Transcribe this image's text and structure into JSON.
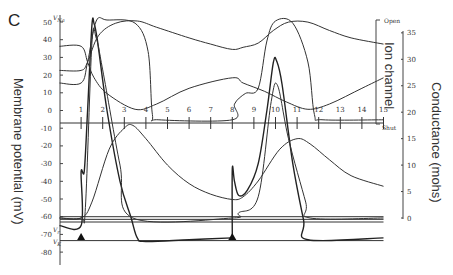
{
  "chart_data": {
    "type": "line",
    "panel_label": "C",
    "left_axis": {
      "title": "Membrane potential (mV)",
      "ticks": [
        50,
        40,
        30,
        20,
        10,
        0,
        -10,
        -20,
        -30,
        -40,
        -50,
        -60,
        -70,
        -80
      ],
      "tick_labels": [
        "50",
        "40",
        "30",
        "20",
        "10",
        "0",
        "-10",
        "-20",
        "-30",
        "-40",
        "-50",
        "-60",
        "-70",
        "-80"
      ],
      "range": [
        -85,
        52
      ],
      "markers": [
        {
          "label": "VNa",
          "value": 53
        },
        {
          "label": "Vr",
          "value": -67
        },
        {
          "label": "VK",
          "value": -74
        }
      ]
    },
    "right_axis": {
      "title": "Conductance (mohs)",
      "ticks": [
        0,
        5,
        10,
        15,
        20,
        25,
        30,
        35
      ],
      "tick_labels": [
        "0",
        "5",
        "10",
        "15",
        "20",
        "25",
        "30",
        "35"
      ],
      "range": [
        0,
        35
      ]
    },
    "ion_channel_axis": {
      "title": "Ion channel",
      "top_label": "Open",
      "bottom_label": "Shut"
    },
    "time_axis": {
      "ticks": [
        1,
        2,
        3,
        4,
        5,
        6,
        7,
        8,
        9,
        10,
        11,
        12,
        13,
        14,
        15
      ],
      "tick_labels": [
        "1",
        "2",
        "3",
        "4",
        "5",
        "6",
        "7",
        "8",
        "9",
        "10",
        "11",
        "12",
        "13",
        "14",
        "15"
      ],
      "range": [
        0,
        15
      ]
    },
    "stimuli": [
      {
        "label": "stimulus-1",
        "time": 1
      },
      {
        "label": "stimulus-2",
        "time": 8
      }
    ],
    "series": [
      {
        "name": "Membrane potential (action potential 1)",
        "axis": "left",
        "points": [
          [
            0,
            -65
          ],
          [
            1,
            -65
          ],
          [
            1,
            -35
          ],
          [
            1.15,
            -34
          ],
          [
            1.3,
            0
          ],
          [
            1.5,
            48
          ],
          [
            1.6,
            49
          ],
          [
            1.75,
            40
          ],
          [
            2.2,
            0
          ],
          [
            2.8,
            -40
          ],
          [
            3.3,
            -60
          ],
          [
            3.6,
            -72
          ],
          [
            4,
            -74
          ],
          [
            6,
            -73
          ],
          [
            8,
            -72
          ]
        ]
      },
      {
        "name": "Membrane potential (action potential 2)",
        "axis": "left",
        "points": [
          [
            8,
            -72
          ],
          [
            8,
            -33
          ],
          [
            8.1,
            -40
          ],
          [
            8.3,
            -48
          ],
          [
            8.7,
            -45
          ],
          [
            9.2,
            -30
          ],
          [
            9.6,
            0
          ],
          [
            9.9,
            27
          ],
          [
            10.05,
            28
          ],
          [
            10.3,
            15
          ],
          [
            10.8,
            -30
          ],
          [
            11.3,
            -62
          ],
          [
            11.5,
            -73
          ],
          [
            15,
            -72
          ]
        ]
      },
      {
        "name": "Na conductance",
        "axis": "right",
        "points": [
          [
            0,
            0
          ],
          [
            1,
            0
          ],
          [
            1.2,
            2
          ],
          [
            1.5,
            33
          ],
          [
            1.7,
            34
          ],
          [
            2.0,
            28
          ],
          [
            2.8,
            10
          ],
          [
            3.4,
            0
          ],
          [
            8,
            0
          ],
          [
            8.3,
            1
          ],
          [
            9.2,
            4
          ],
          [
            9.8,
            22
          ],
          [
            10.1,
            25
          ],
          [
            10.6,
            15
          ],
          [
            11.4,
            3
          ],
          [
            11.6,
            0
          ],
          [
            15,
            0
          ]
        ]
      },
      {
        "name": "K conductance",
        "axis": "right",
        "points": [
          [
            0,
            0
          ],
          [
            1,
            0
          ],
          [
            1.5,
            3
          ],
          [
            2.3,
            13
          ],
          [
            3.0,
            17
          ],
          [
            3.4,
            17.5
          ],
          [
            4,
            15
          ],
          [
            5,
            10
          ],
          [
            6,
            6.5
          ],
          [
            7,
            4.5
          ],
          [
            8,
            3.5
          ],
          [
            8.5,
            4
          ],
          [
            9.2,
            7
          ],
          [
            10.2,
            13
          ],
          [
            11,
            15
          ],
          [
            11.6,
            14
          ],
          [
            12.5,
            11
          ],
          [
            13.5,
            8
          ],
          [
            15,
            6
          ]
        ]
      },
      {
        "name": "Na channel (activation)",
        "axis": "channel",
        "points": [
          [
            0,
            0.4
          ],
          [
            1,
            0.4
          ],
          [
            1.3,
            0.6
          ],
          [
            1.7,
            0.99
          ],
          [
            2.2,
            1.0
          ],
          [
            3.5,
            0.97
          ],
          [
            4.1,
            0.7
          ],
          [
            4.3,
            0.1
          ],
          [
            4.6,
            0.05
          ],
          [
            8,
            0.05
          ],
          [
            8.1,
            0.2
          ],
          [
            8.6,
            0.3
          ],
          [
            9.2,
            0.35
          ],
          [
            9.6,
            0.8
          ],
          [
            10,
            0.99
          ],
          [
            10.8,
            0.97
          ],
          [
            11.5,
            0.6
          ],
          [
            11.8,
            0.1
          ],
          [
            12.2,
            0.05
          ],
          [
            15,
            0.05
          ]
        ]
      },
      {
        "name": "Na channel (inactivation)",
        "axis": "channel",
        "points": [
          [
            0,
            0.75
          ],
          [
            1,
            0.75
          ],
          [
            1.3,
            0.6
          ],
          [
            1.6,
            0.45
          ],
          [
            2.2,
            0.3
          ],
          [
            3.5,
            0.15
          ],
          [
            4.5,
            0.2
          ],
          [
            6,
            0.35
          ],
          [
            8,
            0.45
          ],
          [
            8.5,
            0.4
          ],
          [
            9.5,
            0.32
          ],
          [
            10.5,
            0.22
          ],
          [
            11.5,
            0.15
          ],
          [
            12.5,
            0.2
          ],
          [
            14,
            0.35
          ],
          [
            15,
            0.45
          ]
        ]
      },
      {
        "name": "K channel",
        "axis": "channel",
        "points": [
          [
            0,
            0.52
          ],
          [
            1,
            0.52
          ],
          [
            1.3,
            0.6
          ],
          [
            1.8,
            0.85
          ],
          [
            2.6,
            0.97
          ],
          [
            3.6,
            0.99
          ],
          [
            4.5,
            0.93
          ],
          [
            6,
            0.83
          ],
          [
            7,
            0.77
          ],
          [
            8,
            0.72
          ],
          [
            8.5,
            0.74
          ],
          [
            9.2,
            0.78
          ],
          [
            9.9,
            0.9
          ],
          [
            10.6,
            0.98
          ],
          [
            11.5,
            0.98
          ],
          [
            12.5,
            0.9
          ],
          [
            13.5,
            0.83
          ],
          [
            15,
            0.77
          ]
        ]
      }
    ],
    "baselines": [
      {
        "name": "resting-line-1",
        "axis": "left",
        "value": -60
      },
      {
        "name": "resting-line-2",
        "axis": "left",
        "value": -61.5
      },
      {
        "name": "Vr-line",
        "axis": "left",
        "value": -63
      },
      {
        "name": "VK-line",
        "axis": "left",
        "value": -73.5
      }
    ]
  }
}
